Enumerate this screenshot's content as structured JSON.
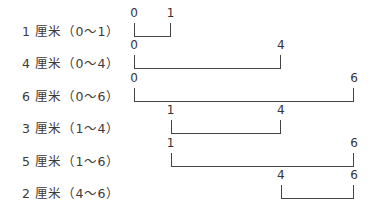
{
  "diagram": {
    "unit_px": 36.7,
    "origin_x": 134,
    "rows": [
      {
        "label": "1 厘米（0～1）",
        "start": 0,
        "end": 1,
        "start_label": "0",
        "end_label": "1",
        "y": 37
      },
      {
        "label": "4 厘米（0～4）",
        "start": 0,
        "end": 4,
        "start_label": "0",
        "end_label": "4",
        "y": 69
      },
      {
        "label": "6 厘米（0～6）",
        "start": 0,
        "end": 6,
        "start_label": "0",
        "end_label": "6",
        "y": 102
      },
      {
        "label": "3 厘米（1～4）",
        "start": 1,
        "end": 4,
        "start_label": "1",
        "end_label": "4",
        "y": 134
      },
      {
        "label": "5 厘米（1～6）",
        "start": 1,
        "end": 6,
        "start_label": "1",
        "end_label": "6",
        "y": 167
      },
      {
        "label": "2 厘米（4～6）",
        "start": 4,
        "end": 6,
        "start_label": "4",
        "end_label": "6",
        "y": 199
      }
    ]
  }
}
